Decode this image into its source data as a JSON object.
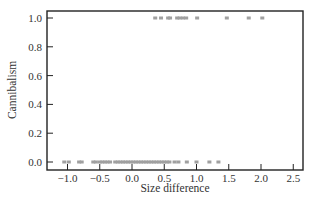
{
  "chart_data": {
    "type": "scatter",
    "title": "",
    "xlabel": "Size difference",
    "ylabel": "Cannibalism",
    "xlim": [
      -1.3,
      2.67
    ],
    "ylim": [
      -0.05,
      1.05
    ],
    "xticks": [
      -1.0,
      -0.5,
      0.0,
      0.5,
      1.0,
      1.5,
      2.0,
      2.5
    ],
    "xtick_labels": [
      "−1.0",
      "−0.5",
      "0.0",
      "0.5",
      "1.0",
      "1.5",
      "2.0",
      "2.5"
    ],
    "yticks": [
      0.0,
      0.2,
      0.4,
      0.6,
      0.8,
      1.0
    ],
    "ytick_labels": [
      "0.0",
      "0.2",
      "0.4",
      "0.6",
      "0.8",
      "1.0"
    ],
    "grid": false,
    "legend": null,
    "marker_color": "#a0a0a0",
    "series": [
      {
        "name": "Cannibalism = 0",
        "y": 0,
        "x": [
          -1.05,
          -0.98,
          -0.82,
          -0.78,
          -0.6,
          -0.56,
          -0.5,
          -0.46,
          -0.42,
          -0.38,
          -0.34,
          -0.26,
          -0.22,
          -0.18,
          -0.14,
          -0.1,
          -0.06,
          -0.02,
          0.02,
          0.06,
          0.1,
          0.14,
          0.18,
          0.22,
          0.26,
          0.3,
          0.34,
          0.38,
          0.42,
          0.46,
          0.5,
          0.54,
          0.58,
          0.66,
          0.72,
          0.85,
          1.0,
          1.2,
          1.34
        ]
      },
      {
        "name": "Cannibalism = 1",
        "y": 1,
        "x": [
          0.36,
          0.45,
          0.56,
          0.59,
          0.7,
          0.74,
          0.79,
          0.84,
          1.01,
          1.47,
          1.81,
          2.02
        ]
      }
    ]
  }
}
